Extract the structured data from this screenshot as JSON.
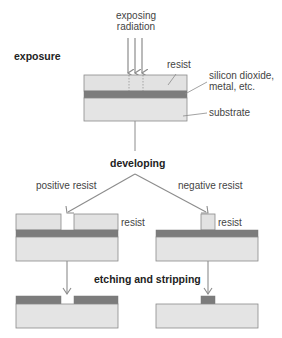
{
  "colors": {
    "resist": "#e2e2e2",
    "substrate": "#e4e4e4",
    "oxide": "#7c7c7c",
    "outline": "#8a8a8a",
    "arrow": "#8c8c8c",
    "text": "#444444"
  },
  "labels": {
    "exposing_radiation_line1": "exposing",
    "exposing_radiation_line2": "radiation",
    "exposure": "exposure",
    "resist_top": "resist",
    "oxide_line1": "silicon dioxide,",
    "oxide_line2": "metal, etc.",
    "substrate": "substrate",
    "developing": "developing",
    "positive_resist": "positive resist",
    "negative_resist": "negative resist",
    "resist_left": "resist",
    "resist_right": "resist",
    "etching_and_stripping": "etching and stripping"
  },
  "stages": [
    {
      "name": "exposure",
      "layers": [
        "resist",
        "oxide",
        "substrate"
      ]
    },
    {
      "name": "developed-positive",
      "layers": [
        "resist (window opened)",
        "oxide",
        "substrate"
      ]
    },
    {
      "name": "developed-negative",
      "layers": [
        "resist (exposed pillar remains)",
        "oxide",
        "substrate"
      ]
    },
    {
      "name": "etched-positive",
      "layers": [
        "oxide (window opened)",
        "substrate"
      ]
    },
    {
      "name": "etched-negative",
      "layers": [
        "oxide (pad remains)",
        "substrate"
      ]
    }
  ]
}
